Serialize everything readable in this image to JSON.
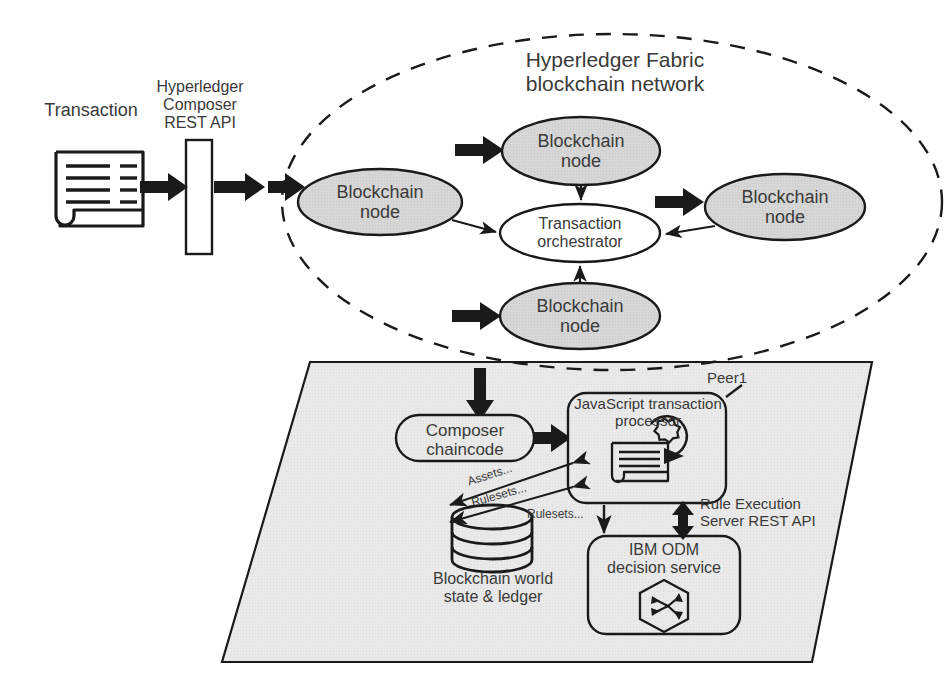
{
  "diagram": {
    "colors": {
      "node_fill": "#d4d4d4",
      "plane_fill": "#e8e8e8",
      "stroke": "#1a1a1a",
      "text": "#3a3a3a",
      "white": "#ffffff"
    }
  },
  "left_flow": {
    "transaction_label": "Transaction",
    "rest_api_label": "Hyperledger\nComposer\nREST API",
    "transaction_icon": "document-icon"
  },
  "network": {
    "title": "Hyperledger Fabric\nblockchain network",
    "boundary": "dashed-ellipse",
    "orchestrator": "Transaction\norchestrator",
    "nodes": [
      {
        "id": "node-left",
        "label": "Blockchain\nnode"
      },
      {
        "id": "node-top",
        "label": "Blockchain\nnode"
      },
      {
        "id": "node-right",
        "label": "Blockchain\nnode"
      },
      {
        "id": "node-bottom",
        "label": "Blockchain\nnode"
      }
    ]
  },
  "peer": {
    "peer_label": "Peer1",
    "chaincode": "Composer\nchaincode",
    "processor": "JavaScript transaction\nprocessor",
    "processor_icon": "document-gear-icon",
    "decision_service": "IBM ODM\ndecision service",
    "decision_icon": "hexagon-decision-icon",
    "ledger_label": "Blockchain world\nstate & ledger",
    "ledger_icon": "database-cylinder-icon",
    "rest_api_label": "Rule Execution\nServer REST API",
    "edge_labels": {
      "assets": "Assets...",
      "rulesets_upper": "Rulesets...",
      "rulesets_lower": "Rulesets..."
    }
  }
}
